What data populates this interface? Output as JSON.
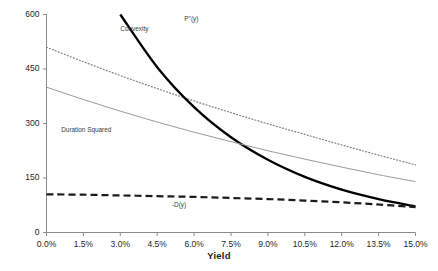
{
  "chart_data": {
    "type": "line",
    "title": "",
    "xlabel": "Yield",
    "ylabel": "",
    "xlim": [
      0.0,
      15.0
    ],
    "ylim": [
      0,
      600
    ],
    "grid": false,
    "legend_position": "inline-annotations",
    "x_tick_labels": [
      "0.0%",
      "1.5%",
      "3.0%",
      "4.5%",
      "6.0%",
      "7.5%",
      "9.0%",
      "10.5%",
      "12.0%",
      "13.5%",
      "15.0%"
    ],
    "x_tick_values": [
      0.0,
      1.5,
      3.0,
      4.5,
      6.0,
      7.5,
      9.0,
      10.5,
      12.0,
      13.5,
      15.0
    ],
    "y_tick_labels": [
      "0",
      "150",
      "300",
      "450",
      "600"
    ],
    "y_tick_values": [
      0,
      150,
      300,
      450,
      600
    ],
    "x": [
      0.0,
      1.5,
      3.0,
      4.5,
      6.0,
      7.5,
      9.0,
      10.5,
      12.0,
      13.5,
      15.0
    ],
    "series": [
      {
        "name": "Convexity",
        "style": "dotted",
        "color": "#808080",
        "width": 1.2,
        "label": "Convexity",
        "label_x": 3.0,
        "label_y": 558,
        "values": [
          510,
          470,
          432,
          396,
          362,
          330,
          299,
          270,
          241,
          213,
          186
        ]
      },
      {
        "name": "P''(y)",
        "style": "solid-thick",
        "color": "#000000",
        "width": 2.3,
        "label": "P''(y)",
        "label_x": 5.6,
        "label_y": 585,
        "values": [
          null,
          null,
          600,
          455,
          345,
          262,
          200,
          153,
          118,
          92,
          72
        ]
      },
      {
        "name": "Duration Squared",
        "style": "solid-thin",
        "color": "#9a9a9a",
        "width": 1.0,
        "label": "Duration Squared",
        "label_x": 0.6,
        "label_y": 278,
        "values": [
          400,
          366,
          334,
          304,
          276,
          250,
          225,
          202,
          180,
          159,
          140
        ]
      },
      {
        "name": "-D(y)",
        "style": "dashed",
        "color": "#1a1a1a",
        "width": 2.2,
        "label": "-D(y)",
        "label_x": 5.1,
        "label_y": 72,
        "values": [
          105,
          104,
          102,
          100,
          98,
          95,
          92,
          88,
          83,
          77,
          70
        ]
      }
    ]
  }
}
